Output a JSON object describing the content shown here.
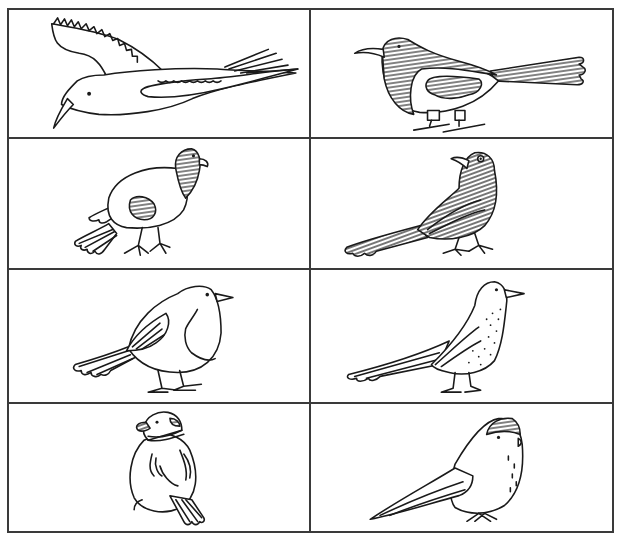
{
  "page": {
    "type": "illustration-grid",
    "rows": 4,
    "columns": 2,
    "border_color": "#3a3a3a",
    "line_color": "#1a1a1a",
    "background": "#ffffff"
  },
  "cells": [
    {
      "row": 0,
      "col": 0,
      "subject": "seagull in flight",
      "style": "outline with scalloped wing feathers"
    },
    {
      "row": 0,
      "col": 1,
      "subject": "magpie",
      "style": "hatched head, back and wing, long striped tail"
    },
    {
      "row": 1,
      "col": 0,
      "subject": "pigeon",
      "style": "hatched head, white body"
    },
    {
      "row": 1,
      "col": 1,
      "subject": "blackbird",
      "style": "fully hatched body and tail"
    },
    {
      "row": 2,
      "col": 0,
      "subject": "robin",
      "style": "outline with breast patch"
    },
    {
      "row": 2,
      "col": 1,
      "subject": "thrush",
      "style": "outline with speckled breast"
    },
    {
      "row": 3,
      "col": 0,
      "subject": "sparrow",
      "style": "plump outline with dark beak and collar"
    },
    {
      "row": 3,
      "col": 1,
      "subject": "tit",
      "style": "round outline with shaded cap"
    }
  ]
}
